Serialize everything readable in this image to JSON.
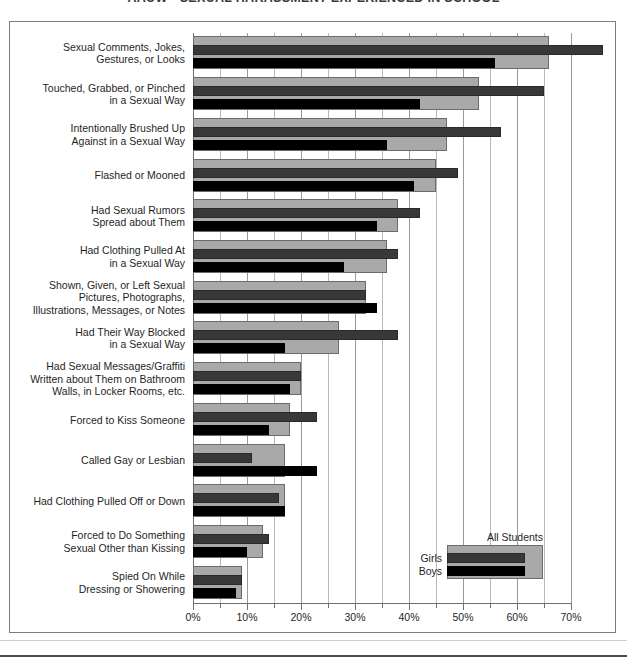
{
  "title": "AAUW  •  SEXUAL HARASSMENT EXPERIENCED IN SCHOOL",
  "legend": {
    "all_students": "All Students",
    "girls": "Girls",
    "boys": "Boys"
  },
  "axis": {
    "ticks": [
      "0%",
      "10%",
      "20%",
      "30%",
      "40%",
      "50%",
      "60%",
      "70%"
    ],
    "minor_step_percent": 5
  },
  "colors": {
    "all_students": "#a9a9a9",
    "girls": "#383838",
    "boys": "#000000",
    "grid": "#b9b9b9",
    "frame": "#7d7d7d"
  },
  "chart_data": {
    "type": "bar",
    "orientation": "horizontal",
    "title": "AAUW  •  SEXUAL HARASSMENT EXPERIENCED IN SCHOOL",
    "xlabel": "",
    "ylabel": "",
    "xlim": [
      0,
      70
    ],
    "xticks": [
      0,
      10,
      20,
      30,
      40,
      50,
      60,
      70
    ],
    "xtick_labels": [
      "0%",
      "10%",
      "20%",
      "30%",
      "40%",
      "50%",
      "60%",
      "70%"
    ],
    "grid": true,
    "legend_position": "inside-bottom-right",
    "categories": [
      "Sexual Comments, Jokes,\nGestures, or Looks",
      "Touched, Grabbed, or Pinched\nin a Sexual Way",
      "Intentionally Brushed Up\nAgainst in a Sexual Way",
      "Flashed or Mooned",
      "Had Sexual Rumors\nSpread about Them",
      "Had Clothing Pulled At\nin a Sexual Way",
      "Shown, Given, or Left Sexual\nPictures, Photographs,\nIllustrations, Messages, or Notes",
      "Had Their Way Blocked\nin a Sexual Way",
      "Had Sexual Messages/Graffiti\nWritten about Them on Bathroom\nWalls, in Locker Rooms, etc.",
      "Forced to Kiss Someone",
      "Called Gay or Lesbian",
      "Had Clothing Pulled Off or Down",
      "Forced to Do Something\nSexual Other than Kissing",
      "Spied On While\nDressing or Showering"
    ],
    "series": [
      {
        "name": "All Students",
        "color": "#a9a9a9",
        "values": [
          66,
          53,
          47,
          45,
          38,
          36,
          32,
          27,
          20,
          18,
          17,
          17,
          13,
          9
        ]
      },
      {
        "name": "Girls",
        "color": "#383838",
        "values": [
          76,
          65,
          57,
          49,
          42,
          38,
          32,
          38,
          20,
          23,
          11,
          16,
          14,
          9
        ]
      },
      {
        "name": "Boys",
        "color": "#000000",
        "values": [
          56,
          42,
          36,
          41,
          34,
          28,
          34,
          17,
          18,
          14,
          23,
          17,
          10,
          8
        ]
      }
    ]
  }
}
